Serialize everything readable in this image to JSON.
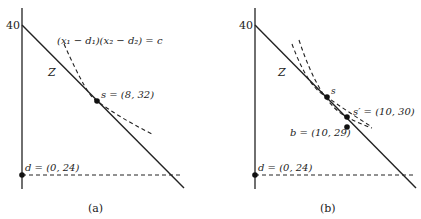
{
  "panels": [
    {
      "id": "a",
      "caption": "(a)",
      "y_axis_tick": "40",
      "line_label": "Z",
      "curve_label": "(x₁ − d₁)(x₂ − d₂) = c",
      "points": [
        {
          "name": "s",
          "label": "s = (8, 32)",
          "x": 8,
          "y": 32
        },
        {
          "name": "d",
          "label": "d = (0, 24)",
          "x": 0,
          "y": 24
        }
      ]
    },
    {
      "id": "b",
      "caption": "(b)",
      "y_axis_tick": "40",
      "line_label": "Z",
      "points": [
        {
          "name": "s",
          "label": "s"
        },
        {
          "name": "s_prime",
          "label": "s′ = (10, 30)",
          "x": 10,
          "y": 30
        },
        {
          "name": "b",
          "label": "b = (10, 29)",
          "x": 10,
          "y": 29
        },
        {
          "name": "d",
          "label": "d = (0, 24)",
          "x": 0,
          "y": 24
        }
      ]
    }
  ],
  "colors": {
    "ink": "#222222",
    "background": "#ffffff"
  }
}
